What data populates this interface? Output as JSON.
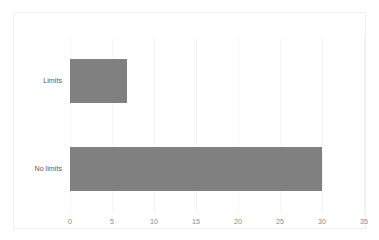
{
  "chart_data": {
    "type": "bar",
    "orientation": "horizontal",
    "title": "",
    "xlabel": "",
    "ylabel": "",
    "categories": [
      "Limits",
      "No limits"
    ],
    "values": [
      6.8,
      30
    ],
    "xlim": [
      0,
      35
    ],
    "xticks": [
      0,
      5,
      10,
      15,
      20,
      25,
      30,
      35
    ],
    "xtick_labels": [
      "0",
      "5",
      "10",
      "15",
      "20",
      "25",
      "30",
      "35"
    ],
    "grid": true,
    "grid_axis": "x",
    "legend": false,
    "legend_position": "none",
    "series": [
      {
        "name": "",
        "values": [
          6.8,
          30
        ],
        "color": "#808080"
      }
    ],
    "colors": {
      "bar_fill": "#808080",
      "gridline": "#f4f4f4",
      "border": "#f0f0f0",
      "category_label_text": "#5a5a5a",
      "tick_label_text": "#8a8a8a",
      "plot_background": "#ffffff"
    }
  }
}
